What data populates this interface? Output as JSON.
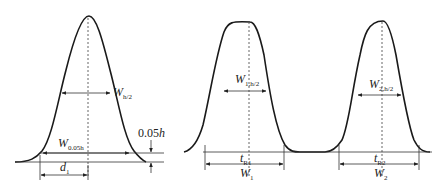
{
  "diagram": {
    "type": "chromatogram-peak-width-definitions",
    "left_panel": {
      "labels": {
        "half_height_width": {
          "main": "W",
          "sub": "h/2"
        },
        "width_at_5pct": {
          "main": "W",
          "sub": "0.05h"
        },
        "height_marker": {
          "prefix": "0.05",
          "italic": "h"
        },
        "distance": {
          "main": "d",
          "sub": "1"
        }
      }
    },
    "right_panel": {
      "peak1": {
        "half_height_width": {
          "main": "W",
          "sub": "1,h/2"
        },
        "retention_time": {
          "main": "t",
          "sub": "R1"
        },
        "base_width": {
          "main": "W",
          "sub": "1"
        }
      },
      "peak2": {
        "half_height_width": {
          "main": "W",
          "sub": "2,h/2"
        },
        "retention_time": {
          "main": "t",
          "sub": "R2"
        },
        "base_width": {
          "main": "W",
          "sub": "2"
        }
      }
    }
  }
}
